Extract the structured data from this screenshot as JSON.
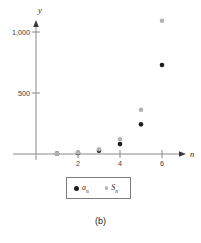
{
  "figure": {
    "caption": "(b)"
  },
  "chart_data": {
    "type": "scatter",
    "title": "",
    "xlabel": "n",
    "ylabel": "y",
    "x": [
      1,
      2,
      3,
      4,
      5,
      6
    ],
    "series": [
      {
        "name": "a_n",
        "label_base": "a",
        "label_sub": "n",
        "color": "#1c1c1c",
        "values": [
          3,
          9,
          27,
          81,
          243,
          729
        ]
      },
      {
        "name": "S_n",
        "label_base": "S",
        "label_sub": "n",
        "color": "#b3b3b3",
        "values": [
          3,
          12,
          39,
          120,
          363,
          1092
        ]
      }
    ],
    "x_ticks": [
      {
        "value": 2,
        "label": "2"
      },
      {
        "value": 4,
        "label": "4"
      },
      {
        "value": 6,
        "label": "6"
      }
    ],
    "y_ticks": [
      {
        "value": 500,
        "label": "500"
      },
      {
        "value": 1000,
        "label": "1,000"
      }
    ],
    "xlim": [
      0,
      7
    ],
    "ylim": [
      0,
      1150
    ],
    "grid": false,
    "legend_position": "bottom",
    "axis_color": "#8a8a8a",
    "point_radius": 2.3
  }
}
